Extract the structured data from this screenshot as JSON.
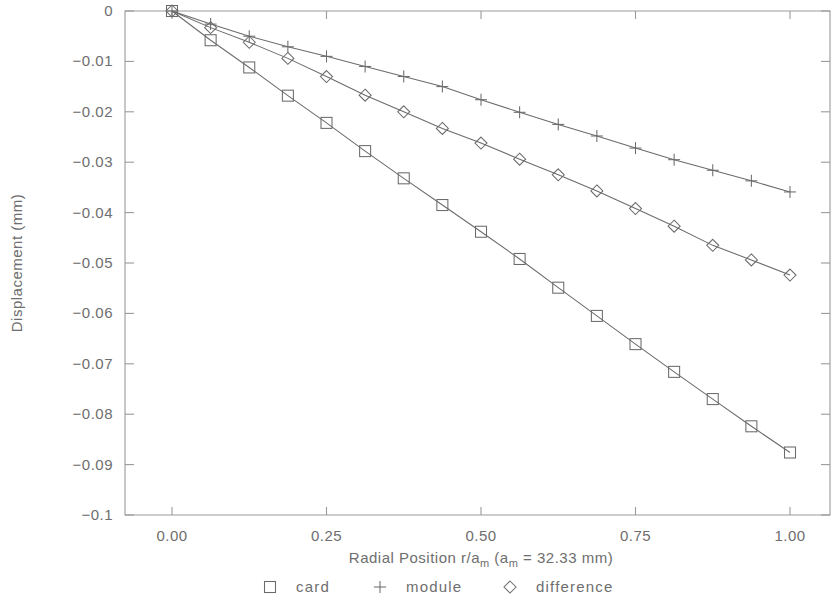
{
  "chart_data": {
    "type": "line",
    "title": "",
    "xlabel": "Radial Position r/a_m (a_m = 32.33 mm)",
    "xlabel_parts": {
      "prefix": "Radial Position r/a",
      "sub1": "m",
      "mid": " (a",
      "sub2": "m",
      "suffix": " = 32.33 mm)"
    },
    "ylabel": "Displacement (mm)",
    "xlim": [
      0.0,
      1.0
    ],
    "ylim": [
      -0.1,
      0.0
    ],
    "grid": false,
    "legend_position": "below-axis",
    "xticks": [
      0.0,
      0.25,
      0.5,
      0.75,
      1.0
    ],
    "xticklabels": [
      "0.00",
      "0.25",
      "0.50",
      "0.75",
      "1.00"
    ],
    "yticks": [
      0.0,
      -0.01,
      -0.02,
      -0.03,
      -0.04,
      -0.05,
      -0.06,
      -0.07,
      -0.08,
      -0.09,
      -0.1
    ],
    "yticklabels": [
      "0",
      "-0.01",
      "-0.02",
      "-0.03",
      "-0.04",
      "-0.05",
      "-0.06",
      "-0.07",
      "-0.08",
      "-0.09",
      "-0.1"
    ],
    "x": [
      0.0,
      0.0625,
      0.125,
      0.1875,
      0.25,
      0.3125,
      0.375,
      0.4375,
      0.5,
      0.5625,
      0.625,
      0.6875,
      0.75,
      0.8125,
      0.875,
      0.9375,
      1.0
    ],
    "series": [
      {
        "name": "card",
        "marker": "square",
        "values": [
          0.0,
          -0.0058,
          -0.0112,
          -0.0168,
          -0.0222,
          -0.0278,
          -0.0332,
          -0.0385,
          -0.0438,
          -0.0492,
          -0.0549,
          -0.0605,
          -0.0661,
          -0.0716,
          -0.077,
          -0.0824,
          -0.0876
        ]
      },
      {
        "name": "module",
        "marker": "plus",
        "values": [
          0.0,
          -0.0026,
          -0.005,
          -0.0071,
          -0.009,
          -0.011,
          -0.013,
          -0.015,
          -0.0176,
          -0.0201,
          -0.0225,
          -0.0248,
          -0.0272,
          -0.0295,
          -0.0316,
          -0.0337,
          -0.0359
        ]
      },
      {
        "name": "difference",
        "marker": "diamond",
        "values": [
          0.0,
          -0.0033,
          -0.0062,
          -0.0094,
          -0.013,
          -0.0167,
          -0.02,
          -0.0233,
          -0.0262,
          -0.0294,
          -0.0325,
          -0.0357,
          -0.0392,
          -0.0427,
          -0.0465,
          -0.0494,
          -0.0524
        ]
      }
    ]
  },
  "legend": {
    "items": [
      {
        "marker": "square",
        "label": "card"
      },
      {
        "marker": "plus",
        "label": "module"
      },
      {
        "marker": "diamond",
        "label": "difference"
      }
    ]
  },
  "colors": {
    "line": "#6b6b6b",
    "axis": "#9a9a9a",
    "text": "#6e6e6e",
    "background": "#ffffff"
  }
}
